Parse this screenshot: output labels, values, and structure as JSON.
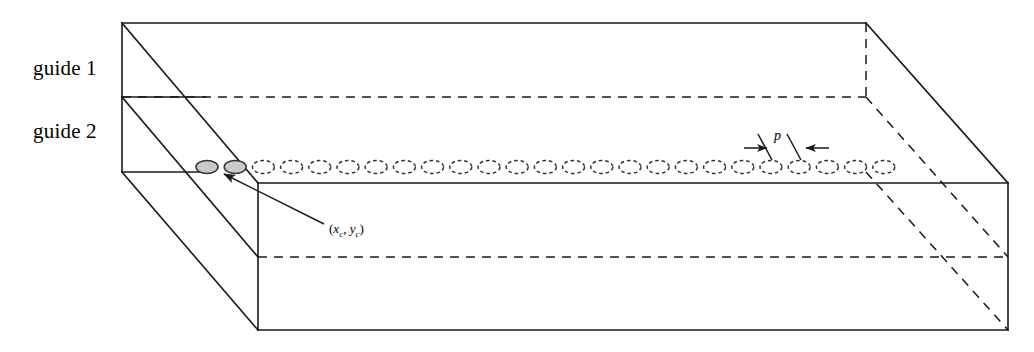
{
  "figure": {
    "kind": "3d-waveguide-schematic",
    "background_color": "#ffffff",
    "line_color": "#1a1a1a",
    "hole_fill_color": "#c9c9c9",
    "hole_stroke_color": "#333333"
  },
  "labels": {
    "guide1": "guide 1",
    "guide2": "guide 2",
    "pitch": "p",
    "center_coord": {
      "open": "(",
      "x": "x",
      "x_sub": "c",
      "comma": ", ",
      "y": "y",
      "y_sub": "c",
      "close": ")",
      "full": "(xc, yc)"
    }
  },
  "geometry": {
    "box": {
      "front_top_left": [
        258,
        183
      ],
      "front_top_right": [
        1008,
        183
      ],
      "front_bottom_left": [
        258,
        330
      ],
      "front_bottom_right": [
        1008,
        330
      ],
      "left_top_front": [
        122,
        23
      ],
      "left_mid_front": [
        122,
        97
      ],
      "left_bottom_front": [
        122,
        172
      ],
      "back_top_right": [
        866,
        23
      ],
      "back_mid_right": [
        866,
        97
      ],
      "back_bottom_right": [
        866,
        172
      ]
    },
    "guide_divider_y": 97,
    "hole_row": {
      "count": 25,
      "start_x": 207,
      "pitch": 28.2,
      "center_y": 167,
      "rx": 11,
      "ry": 6.5,
      "filled_count": 2
    },
    "pitch_marker": {
      "label_x": 779,
      "label_y": 136,
      "left_arrow_from": [
        744,
        148
      ],
      "left_arrow_to": [
        768,
        148
      ],
      "right_arrow_from": [
        828,
        148
      ],
      "right_arrow_to": [
        806,
        148
      ],
      "leader_left": [
        [
          770,
          155
        ],
        [
          760,
          140
        ]
      ],
      "leader_right": [
        [
          800,
          155
        ],
        [
          790,
          140
        ]
      ]
    },
    "coord_leader": {
      "arrow_tip": [
        221,
        172
      ],
      "tail": [
        324,
        224
      ],
      "label_x": 329,
      "label_y": 228
    }
  }
}
